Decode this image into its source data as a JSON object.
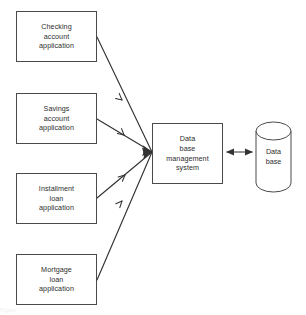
{
  "diagram": {
    "type": "flow-diagram",
    "background_color": "#ffffff",
    "stroke_color": "#4a4a4a",
    "text_color": "#2e2e2e",
    "input_nodes": [
      {
        "id": "checking-account-application",
        "shape": "rectangle",
        "lines": [
          "Checking",
          "account",
          "application"
        ],
        "x": 16,
        "y": 11,
        "w": 81,
        "h": 51
      },
      {
        "id": "savings-account-application",
        "shape": "rectangle",
        "lines": [
          "Savings",
          "account",
          "application"
        ],
        "x": 16,
        "y": 93,
        "w": 81,
        "h": 51
      },
      {
        "id": "installment-loan-application",
        "shape": "rectangle",
        "lines": [
          "Installment",
          "loan",
          "application"
        ],
        "x": 16,
        "y": 173,
        "w": 81,
        "h": 51
      },
      {
        "id": "mortgage-loan-application",
        "shape": "rectangle",
        "lines": [
          "Mortgage",
          "loan",
          "application"
        ],
        "x": 16,
        "y": 254,
        "w": 81,
        "h": 51
      }
    ],
    "process_node": {
      "id": "database-management-system",
      "shape": "rectangle",
      "lines": [
        "Data",
        "base",
        "management",
        "system"
      ],
      "x": 152,
      "y": 123,
      "w": 71,
      "h": 61
    },
    "store_node": {
      "id": "database-cylinder",
      "shape": "cylinder",
      "lines": [
        "Data",
        "base"
      ],
      "x": 256,
      "y": 121,
      "w": 35,
      "h": 71
    },
    "connectors": [
      {
        "id": "checking-to-dbms",
        "from": "checking-account-application",
        "to": "database-management-system",
        "style": "single-arrow",
        "midpoint_arrowhead": true
      },
      {
        "id": "savings-to-dbms",
        "from": "savings-account-application",
        "to": "database-management-system",
        "style": "single-arrow",
        "midpoint_arrowhead": true
      },
      {
        "id": "installment-to-dbms",
        "from": "installment-loan-application",
        "to": "database-management-system",
        "style": "single-arrow",
        "midpoint_arrowhead": true
      },
      {
        "id": "mortgage-to-dbms",
        "from": "mortgage-loan-application",
        "to": "database-management-system",
        "style": "single-arrow",
        "midpoint_arrowhead": true
      },
      {
        "id": "dbms-to-database",
        "from": "database-management-system",
        "to": "database-cylinder",
        "style": "double-arrow",
        "midpoint_arrowhead": false
      }
    ],
    "footer_fragment": "Figure"
  }
}
